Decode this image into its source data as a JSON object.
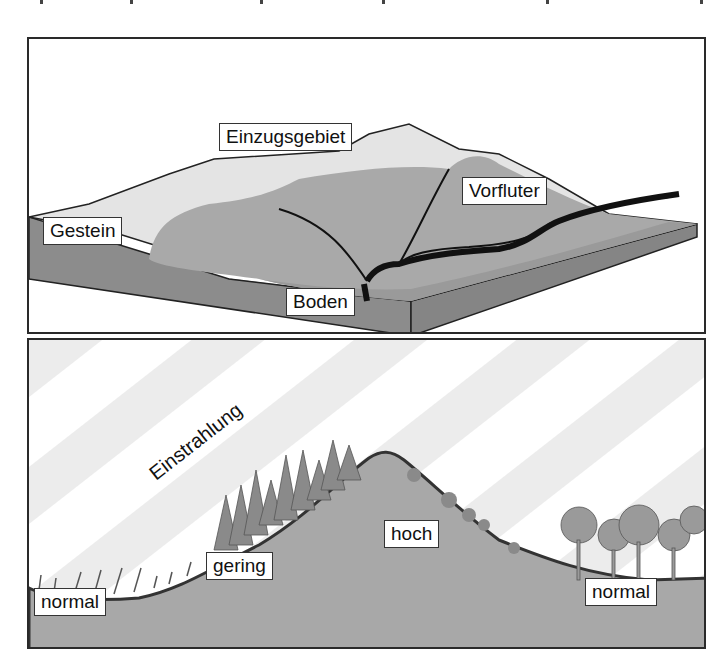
{
  "figure": {
    "top_panel": {
      "title": "Einzugsgebiet diagram",
      "labels": {
        "einzugsgebiet": "Einzugsgebiet",
        "vorfluter": "Vorfluter",
        "gestein": "Gestein",
        "boden": "Boden"
      }
    },
    "bottom_panel": {
      "title": "Einstrahlung slope diagram",
      "labels": {
        "einstrahlung": "Einstrahlung",
        "normal_left": "normal",
        "gering": "gering",
        "hoch": "hoch",
        "normal_right": "normal"
      }
    },
    "colors": {
      "frame": "#2a2a2a",
      "surface_light": "#e6e6e6",
      "surface_mid": "#a9a9a9",
      "side": "#8c8c8c",
      "river": "#111111",
      "hill": "#a8a8a8",
      "ray": "#ececec",
      "tree": "#8a8a8a"
    }
  }
}
